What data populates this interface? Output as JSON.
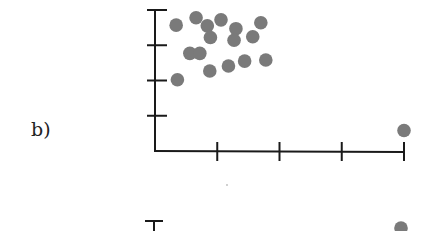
{
  "panel_label": "b)",
  "colors": {
    "axis": "#1a1a1a",
    "point": "#7a7a7a"
  },
  "chart_data": {
    "type": "scatter",
    "title": "",
    "xlabel": "",
    "ylabel": "",
    "grid": false,
    "legend": null,
    "xlim": [
      0,
      4
    ],
    "ylim": [
      0,
      4
    ],
    "x_ticks": [
      1,
      2,
      3,
      4
    ],
    "y_ticks": [
      1,
      2,
      3,
      4
    ],
    "tick_labels_shown": false,
    "series": [
      {
        "name": "points",
        "points": [
          [
            0.34,
            3.57
          ],
          [
            0.66,
            3.78
          ],
          [
            0.84,
            3.55
          ],
          [
            1.06,
            3.72
          ],
          [
            1.3,
            3.47
          ],
          [
            1.7,
            3.64
          ],
          [
            0.89,
            3.22
          ],
          [
            1.27,
            3.14
          ],
          [
            1.57,
            3.24
          ],
          [
            0.56,
            2.77
          ],
          [
            0.72,
            2.77
          ],
          [
            0.88,
            2.27
          ],
          [
            1.18,
            2.41
          ],
          [
            1.44,
            2.55
          ],
          [
            1.78,
            2.58
          ],
          [
            0.36,
            2.02
          ],
          [
            4.0,
            0.58
          ]
        ]
      }
    ],
    "second_panel_partial": {
      "note": "top of another chart visible at bottom edge",
      "y_axis_top_tick_visible": true,
      "points": [
        [
          4.0,
          "top"
        ]
      ]
    }
  }
}
